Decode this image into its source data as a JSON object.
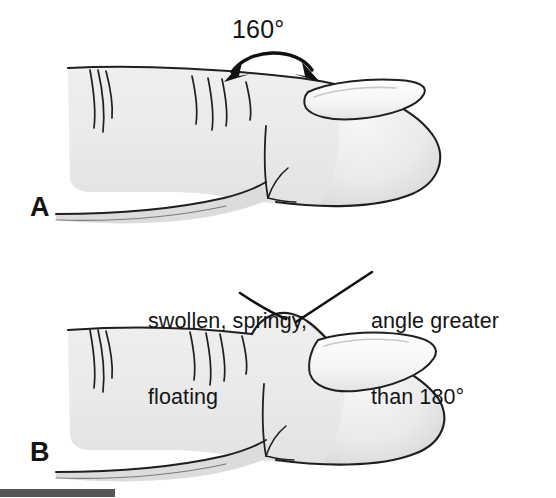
{
  "figure": {
    "panels": [
      {
        "letter": "A",
        "name": "normal-finger",
        "description": "Normal finger in profile with nail angle of 160 degrees",
        "annotation": "160°"
      },
      {
        "letter": "B",
        "name": "clubbed-finger",
        "description": "Clubbed finger in profile with swollen nail base and nail angle greater than 180 degrees",
        "callouts": [
          "swollen, springy,\nfloating",
          "angle greater\nthan 180°"
        ]
      }
    ]
  },
  "annotations": {
    "angle_normal": "160°",
    "callout_left_line1": "swollen, springy,",
    "callout_left_line2": "floating",
    "callout_right_line1": "angle greater",
    "callout_right_line2": "than 180°"
  },
  "panel_labels": {
    "a": "A",
    "b": "B"
  },
  "colors": {
    "background": "#ffffff",
    "ink": "#141414",
    "skin_fill": "#ebebeb",
    "skin_fill_dark": "#dcdcdc",
    "nail_fill": "#f7f7f7",
    "footer_bar": "#565656"
  }
}
